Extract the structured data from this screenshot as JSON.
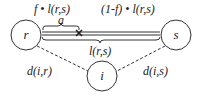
{
  "diagram": {
    "labels": {
      "top_left": "f • l(r,s)",
      "top_right": "(1-f) • l(r,s)",
      "a": "a",
      "middle": "l(r,s)",
      "left_edge": "d(i,r)",
      "right_edge": "d(i,s)"
    },
    "nodes": [
      {
        "id": "r",
        "label": "r"
      },
      {
        "id": "s",
        "label": "s"
      },
      {
        "id": "i",
        "label": "i"
      }
    ],
    "colors": {
      "stroke": "#333333",
      "background": "#ffffff"
    }
  }
}
